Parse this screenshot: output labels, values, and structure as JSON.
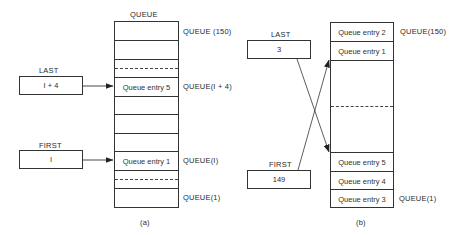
{
  "panel_a": {
    "caption": "(a)",
    "queue_title": "QUEUE",
    "last": {
      "label": "LAST",
      "value": "I + 4"
    },
    "first": {
      "label": "FIRST",
      "value": "I"
    },
    "entries": {
      "last_entry": "Queue entry 5",
      "first_entry": "Queue entry 1"
    },
    "index_labels": {
      "top": "QUEUE (150)",
      "last": "QUEUE(I + 4)",
      "first": "QUEUE(I)",
      "bottom": "QUEUE(1)"
    }
  },
  "panel_b": {
    "caption": "(b)",
    "last": {
      "label": "LAST",
      "value": "3"
    },
    "first": {
      "label": "FIRST",
      "value": "149"
    },
    "entries": {
      "row1": "Queue entry 2",
      "row2": "Queue entry 1",
      "row_first": "Queue entry 5",
      "row_mid": "Queue entry 4",
      "row_bottom": "Queue entry 3"
    },
    "index_labels": {
      "top": "QUEUE(150)",
      "bottom": "QUEUE(1)"
    }
  },
  "colors": {
    "line": "#333333",
    "text": "#2a2a2a",
    "background": "#ffffff"
  }
}
